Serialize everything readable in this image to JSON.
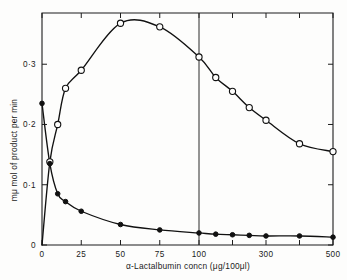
{
  "chart_data": {
    "type": "line",
    "title": "",
    "xlabel": "α-Lactalbumin concn (μg/100μl)",
    "ylabel": "mμ mol of product per min",
    "xlim": [
      0,
      500
    ],
    "ylim": [
      0,
      0.385
    ],
    "grid": false,
    "legend_position": "none",
    "axis_break": {
      "at": 100,
      "note": "x-axis scale compresses after 100; vertical rule drawn at 100"
    },
    "x_ticks": [
      {
        "value": 0,
        "label": "0"
      },
      {
        "value": 25,
        "label": "25"
      },
      {
        "value": 50,
        "label": "50"
      },
      {
        "value": 75,
        "label": "75"
      },
      {
        "value": 100,
        "label": "100"
      },
      {
        "value": 200,
        "label": ""
      },
      {
        "value": 300,
        "label": "300"
      },
      {
        "value": 400,
        "label": ""
      },
      {
        "value": 500,
        "label": "500"
      }
    ],
    "y_ticks": [
      {
        "value": 0,
        "label": "0"
      },
      {
        "value": 0.1,
        "label": "0·1"
      },
      {
        "value": 0.2,
        "label": "0·2"
      },
      {
        "value": 0.3,
        "label": "0·3"
      }
    ],
    "series": [
      {
        "name": "open-circle-series",
        "marker": "open-circle",
        "color": "#111111",
        "points": [
          {
            "x": 0,
            "y": 0.0
          },
          {
            "x": 5,
            "y": 0.138
          },
          {
            "x": 10,
            "y": 0.2
          },
          {
            "x": 15,
            "y": 0.26
          },
          {
            "x": 25,
            "y": 0.29
          },
          {
            "x": 50,
            "y": 0.368
          },
          {
            "x": 75,
            "y": 0.362
          },
          {
            "x": 100,
            "y": 0.312
          },
          {
            "x": 150,
            "y": 0.278
          },
          {
            "x": 200,
            "y": 0.255
          },
          {
            "x": 250,
            "y": 0.228
          },
          {
            "x": 300,
            "y": 0.207
          },
          {
            "x": 400,
            "y": 0.168
          },
          {
            "x": 500,
            "y": 0.155
          }
        ]
      },
      {
        "name": "filled-circle-series",
        "marker": "filled-circle",
        "color": "#111111",
        "points": [
          {
            "x": 0,
            "y": 0.235
          },
          {
            "x": 5,
            "y": 0.135
          },
          {
            "x": 10,
            "y": 0.085
          },
          {
            "x": 15,
            "y": 0.072
          },
          {
            "x": 25,
            "y": 0.056
          },
          {
            "x": 50,
            "y": 0.034
          },
          {
            "x": 75,
            "y": 0.025
          },
          {
            "x": 100,
            "y": 0.02
          },
          {
            "x": 150,
            "y": 0.018
          },
          {
            "x": 200,
            "y": 0.017
          },
          {
            "x": 250,
            "y": 0.016
          },
          {
            "x": 300,
            "y": 0.015
          },
          {
            "x": 400,
            "y": 0.015
          },
          {
            "x": 500,
            "y": 0.013
          }
        ]
      }
    ]
  }
}
